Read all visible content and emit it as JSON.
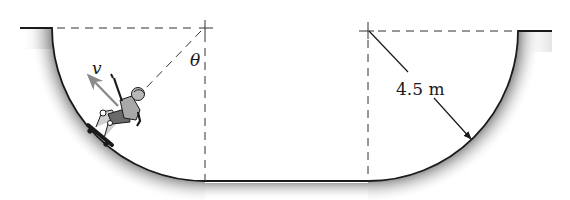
{
  "diagram": {
    "type": "mechanics-figure",
    "labels": {
      "velocity": "v",
      "angle": "θ",
      "radius": "4.5 m"
    },
    "colors": {
      "outline": "#1a1a1a",
      "dashed": "#333333",
      "velocity_arrow": "#8a8a8a",
      "shadow": "#9a9a9a",
      "figure_fill": "#a8a8a8"
    }
  }
}
